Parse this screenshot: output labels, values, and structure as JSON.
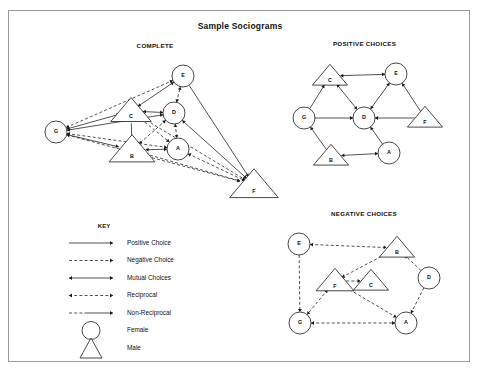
{
  "title": "Sample Sociograms",
  "panels": {
    "complete": {
      "label": "COMPLETE"
    },
    "positive": {
      "label": "POSITIVE CHOICES"
    },
    "negative": {
      "label": "NEGATIVE CHOICES"
    }
  },
  "key": {
    "title": "KEY",
    "items": [
      {
        "label": "Positive  Choice",
        "style": "solid",
        "heads": "single"
      },
      {
        "label": "Negative Choice",
        "style": "dashed",
        "heads": "single"
      },
      {
        "label": "Mutual  Choices",
        "style": "solid",
        "heads": "double"
      },
      {
        "label": "Reciprocal",
        "style": "dashed",
        "heads": "double"
      },
      {
        "label": "Non-Reciprocal",
        "style": "mixed",
        "heads": "single"
      },
      {
        "label": "Female",
        "style": "circle",
        "heads": "none"
      },
      {
        "label": "Male",
        "style": "triangle",
        "heads": "none"
      }
    ]
  },
  "chart_data": {
    "type": "diagram",
    "title": "Sample Sociograms",
    "legend": {
      "position": "bottom-left",
      "entries": [
        "Positive  Choice",
        "Negative Choice",
        "Mutual  Choices",
        "Reciprocal",
        "Non-Reciprocal",
        "Female",
        "Male"
      ],
      "shapes": {
        "Female": "circle",
        "Male": "triangle"
      }
    },
    "graphs": [
      {
        "name": "COMPLETE",
        "nodes": [
          {
            "id": "E",
            "shape": "circle",
            "x": 182,
            "y": 75,
            "r": 11
          },
          {
            "id": "C",
            "shape": "triangle",
            "x": 130,
            "y": 110,
            "r": 15
          },
          {
            "id": "D",
            "shape": "circle",
            "x": 173,
            "y": 112,
            "r": 11
          },
          {
            "id": "G",
            "shape": "circle",
            "x": 55,
            "y": 131,
            "r": 11
          },
          {
            "id": "B",
            "shape": "triangle",
            "x": 131,
            "y": 149,
            "r": 17
          },
          {
            "id": "A",
            "shape": "circle",
            "x": 177,
            "y": 148,
            "r": 11
          },
          {
            "id": "F",
            "shape": "triangle",
            "x": 253,
            "y": 184,
            "r": 18
          }
        ],
        "edges": [
          {
            "from": "G",
            "to": "E",
            "style": "dashed",
            "heads": "double"
          },
          {
            "from": "C",
            "to": "E",
            "style": "solid",
            "heads": "double"
          },
          {
            "from": "D",
            "to": "E",
            "style": "dashed",
            "heads": "double"
          },
          {
            "from": "E",
            "to": "F",
            "style": "solid",
            "heads": "single"
          },
          {
            "from": "G",
            "to": "C",
            "style": "solid",
            "heads": "double"
          },
          {
            "from": "G",
            "to": "D",
            "style": "solid",
            "heads": "double"
          },
          {
            "from": "G",
            "to": "B",
            "style": "solid",
            "heads": "single"
          },
          {
            "from": "G",
            "to": "A",
            "style": "dashed",
            "heads": "double"
          },
          {
            "from": "G",
            "to": "F",
            "style": "dashed",
            "heads": "double"
          },
          {
            "from": "C",
            "to": "D",
            "style": "solid",
            "heads": "double"
          },
          {
            "from": "C",
            "to": "B",
            "style": "solid",
            "heads": "single"
          },
          {
            "from": "C",
            "to": "A",
            "style": "dashed",
            "heads": "double"
          },
          {
            "from": "C",
            "to": "F",
            "style": "dashed",
            "heads": "double"
          },
          {
            "from": "D",
            "to": "A",
            "style": "dashed",
            "heads": "double"
          },
          {
            "from": "D",
            "to": "B",
            "style": "dashed",
            "heads": "double"
          },
          {
            "from": "D",
            "to": "F",
            "style": "solid",
            "heads": "double"
          },
          {
            "from": "B",
            "to": "A",
            "style": "solid",
            "heads": "double"
          },
          {
            "from": "B",
            "to": "F",
            "style": "dashed",
            "heads": "double"
          },
          {
            "from": "A",
            "to": "F",
            "style": "dashed",
            "heads": "double"
          }
        ]
      },
      {
        "name": "POSITIVE CHOICES",
        "nodes": [
          {
            "id": "C",
            "shape": "triangle",
            "x": 329,
            "y": 75,
            "r": 13
          },
          {
            "id": "E",
            "shape": "circle",
            "x": 395,
            "y": 73,
            "r": 11
          },
          {
            "id": "G",
            "shape": "circle",
            "x": 303,
            "y": 117,
            "r": 11
          },
          {
            "id": "D",
            "shape": "circle",
            "x": 363,
            "y": 117,
            "r": 11
          },
          {
            "id": "F",
            "shape": "triangle",
            "x": 424,
            "y": 117,
            "r": 13
          },
          {
            "id": "B",
            "shape": "triangle",
            "x": 330,
            "y": 155,
            "r": 13
          },
          {
            "id": "A",
            "shape": "circle",
            "x": 388,
            "y": 152,
            "r": 11
          }
        ],
        "edges": [
          {
            "from": "C",
            "to": "E",
            "style": "solid",
            "heads": "double"
          },
          {
            "from": "C",
            "to": "D",
            "style": "solid",
            "heads": "double"
          },
          {
            "from": "E",
            "to": "D",
            "style": "solid",
            "heads": "double"
          },
          {
            "from": "G",
            "to": "C",
            "style": "solid",
            "heads": "single"
          },
          {
            "from": "G",
            "to": "D",
            "style": "solid",
            "heads": "single"
          },
          {
            "from": "F",
            "to": "D",
            "style": "solid",
            "heads": "single"
          },
          {
            "from": "F",
            "to": "E",
            "style": "solid",
            "heads": "single"
          },
          {
            "from": "B",
            "to": "G",
            "style": "solid",
            "heads": "single"
          },
          {
            "from": "B",
            "to": "A",
            "style": "solid",
            "heads": "double"
          },
          {
            "from": "A",
            "to": "D",
            "style": "solid",
            "heads": "single"
          }
        ]
      },
      {
        "name": "NEGATIVE CHOICES",
        "nodes": [
          {
            "id": "E",
            "shape": "circle",
            "x": 298,
            "y": 243,
            "r": 11
          },
          {
            "id": "B",
            "shape": "triangle",
            "x": 396,
            "y": 247,
            "r": 13
          },
          {
            "id": "F",
            "shape": "triangle",
            "x": 334,
            "y": 280,
            "r": 14
          },
          {
            "id": "C",
            "shape": "triangle",
            "x": 370,
            "y": 280,
            "r": 13
          },
          {
            "id": "D",
            "shape": "circle",
            "x": 428,
            "y": 277,
            "r": 11
          },
          {
            "id": "G",
            "shape": "circle",
            "x": 299,
            "y": 322,
            "r": 11
          },
          {
            "id": "A",
            "shape": "circle",
            "x": 405,
            "y": 322,
            "r": 11
          }
        ],
        "edges": [
          {
            "from": "E",
            "to": "B",
            "style": "dashed",
            "heads": "double"
          },
          {
            "from": "E",
            "to": "G",
            "style": "dashed",
            "heads": "single"
          },
          {
            "from": "F",
            "to": "B",
            "style": "dashed",
            "heads": "double"
          },
          {
            "from": "F",
            "to": "C",
            "style": "dashed",
            "heads": "single"
          },
          {
            "from": "F",
            "to": "G",
            "style": "dashed",
            "heads": "double"
          },
          {
            "from": "F",
            "to": "A",
            "style": "dashed",
            "heads": "double"
          },
          {
            "from": "D",
            "to": "B",
            "style": "dashed",
            "heads": "single"
          },
          {
            "from": "D",
            "to": "A",
            "style": "dashed",
            "heads": "single"
          },
          {
            "from": "G",
            "to": "A",
            "style": "dashed",
            "heads": "double"
          }
        ]
      }
    ]
  }
}
